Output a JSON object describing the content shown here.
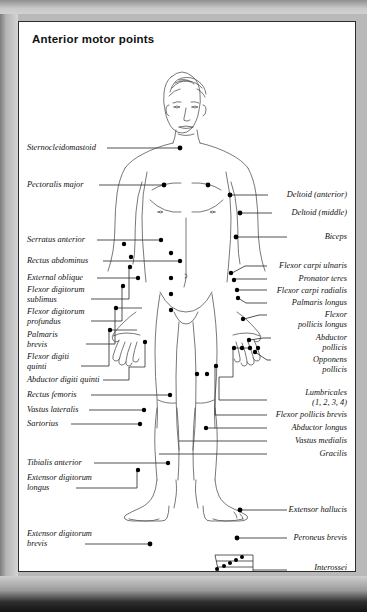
{
  "card": {
    "title": "Anterior motor points",
    "background_color": "#ffffff",
    "border_color": "#2c2c2c"
  },
  "page": {
    "backdrop_color": "#b9b9b9"
  },
  "figure": {
    "type": "anatomical-diagram",
    "marker_color": "#000000",
    "outline_color": "#555555",
    "leader_color": "#333333"
  },
  "labels_left": [
    {
      "id": "sternocleidomastoid",
      "text": "Sternocleidomastoid",
      "x": 8,
      "y": 125,
      "lines": 1
    },
    {
      "id": "pectoralis-major",
      "text": "Pectoralis major",
      "x": 8,
      "y": 162,
      "lines": 1
    },
    {
      "id": "serratus-anterior",
      "text": "Serratus anterior",
      "x": 8,
      "y": 217,
      "lines": 1
    },
    {
      "id": "rectus-abdominus",
      "text": "Rectus abdominus",
      "x": 8,
      "y": 238,
      "lines": 1
    },
    {
      "id": "external-oblique",
      "text": "External oblique",
      "x": 8,
      "y": 255,
      "lines": 1
    },
    {
      "id": "flexor-digitorum-sublimus",
      "text": "Flexor digitorum\nsublimus",
      "x": 8,
      "y": 268,
      "lines": 2
    },
    {
      "id": "flexor-digitorum-profundus",
      "text": "Flexor digitorum\nprofundus",
      "x": 8,
      "y": 290,
      "lines": 2
    },
    {
      "id": "palmaris-brevis",
      "text": "Palmaris\nbrevis",
      "x": 8,
      "y": 312,
      "lines": 2
    },
    {
      "id": "flexor-digiti-quinti",
      "text": "Flexor digiti\nquinti",
      "x": 8,
      "y": 334,
      "lines": 2
    },
    {
      "id": "abductor-digiti-quinti",
      "text": "Abductor digiti quinti",
      "x": 8,
      "y": 357,
      "lines": 1
    },
    {
      "id": "rectus-femoris",
      "text": "Rectus femoris",
      "x": 8,
      "y": 372,
      "lines": 1
    },
    {
      "id": "vastus-lateralis",
      "text": "Vastus lateralis",
      "x": 8,
      "y": 387,
      "lines": 1
    },
    {
      "id": "sartorius",
      "text": "Sartorius",
      "x": 8,
      "y": 401,
      "lines": 1
    },
    {
      "id": "tibialis-anterior",
      "text": "Tibialis anterior",
      "x": 8,
      "y": 440,
      "lines": 1
    },
    {
      "id": "extensor-digitorum-longus",
      "text": "Extensor digitorum\nlongus",
      "x": 8,
      "y": 455,
      "lines": 2
    },
    {
      "id": "extensor-digitorum-brevis",
      "text": "Extensor digitorum\nbrevis",
      "x": 8,
      "y": 511,
      "lines": 2
    }
  ],
  "labels_right": [
    {
      "id": "deltoid-anterior",
      "text": "Deltoid (anterior)",
      "x": 330,
      "y": 172,
      "lines": 1
    },
    {
      "id": "deltoid-middle",
      "text": "Deltoid (middle)",
      "x": 330,
      "y": 190,
      "lines": 1
    },
    {
      "id": "biceps",
      "text": "Biceps",
      "x": 330,
      "y": 214,
      "lines": 1
    },
    {
      "id": "flexor-carpi-ulnaris",
      "text": "Flexor carpi ulnaris",
      "x": 330,
      "y": 243,
      "lines": 1
    },
    {
      "id": "pronator-teres",
      "text": "Pronator teres",
      "x": 330,
      "y": 256,
      "lines": 1
    },
    {
      "id": "flexor-carpi-radialis",
      "text": "Flexor carpi radialis",
      "x": 330,
      "y": 268,
      "lines": 1
    },
    {
      "id": "palmaris-longus",
      "text": "Palmaris longus",
      "x": 330,
      "y": 280,
      "lines": 1
    },
    {
      "id": "flexor-pollicis-longus",
      "text": "Flexor\npollicis longus",
      "x": 330,
      "y": 292,
      "lines": 2
    },
    {
      "id": "abductor-pollicis",
      "text": "Abductor\npollicis",
      "x": 330,
      "y": 315,
      "lines": 2
    },
    {
      "id": "opponens-pollicis",
      "text": "Opponens\npollicis",
      "x": 330,
      "y": 337,
      "lines": 2
    },
    {
      "id": "lumbricales",
      "text": "Lumbricales\n(1, 2, 3, 4)",
      "x": 330,
      "y": 370,
      "lines": 2
    },
    {
      "id": "flexor-pollicis-brevis",
      "text": "Flexor pollicis brevis",
      "x": 330,
      "y": 392,
      "lines": 1
    },
    {
      "id": "abductor-longus",
      "text": "Abductor longus",
      "x": 330,
      "y": 405,
      "lines": 1
    },
    {
      "id": "vastus-medialis",
      "text": "Vastus medialis",
      "x": 330,
      "y": 418,
      "lines": 1
    },
    {
      "id": "gracilis",
      "text": "Gracilis",
      "x": 330,
      "y": 431,
      "lines": 1
    },
    {
      "id": "extensor-hallucis",
      "text": "Extensor hallucis",
      "x": 330,
      "y": 487,
      "lines": 1
    },
    {
      "id": "peroneus-brevis",
      "text": "Peroneus brevis",
      "x": 330,
      "y": 515,
      "lines": 1
    },
    {
      "id": "interossei",
      "text": "Interossei\n(1, 2, 3, 4, 5)",
      "x": 330,
      "y": 562,
      "lines": 2
    }
  ]
}
